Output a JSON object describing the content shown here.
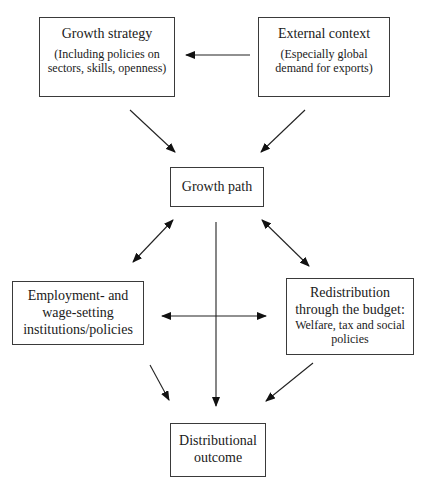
{
  "diagram": {
    "nodes": {
      "growth_strategy": {
        "title": "Growth strategy",
        "subtitle_line1": "(Including policies on",
        "subtitle_line2": "sectors, skills, openness)"
      },
      "external_context": {
        "title": "External context",
        "subtitle_line1": "(Especially global",
        "subtitle_line2": "demand for exports)"
      },
      "growth_path": {
        "title": "Growth path"
      },
      "employment_institutions": {
        "title_line1": "Employment- and",
        "title_line2": "wage-setting",
        "title_line3": "institutions/policies"
      },
      "redistribution": {
        "title_line1": "Redistribution",
        "title_line2": "through the budget:",
        "subtitle_line1": "Welfare, tax and social",
        "subtitle_line2": "policies"
      },
      "distributional_outcome": {
        "title_line1": "Distributional",
        "title_line2": "outcome"
      }
    },
    "edges": [
      {
        "from": "External context",
        "to": "Growth strategy",
        "type": "one-way"
      },
      {
        "from": "Growth strategy",
        "to": "Growth path",
        "type": "one-way"
      },
      {
        "from": "External context",
        "to": "Growth path",
        "type": "one-way"
      },
      {
        "from": "Growth path",
        "to": "Employment- and wage-setting institutions/policies",
        "type": "two-way"
      },
      {
        "from": "Growth path",
        "to": "Redistribution through the budget",
        "type": "two-way"
      },
      {
        "from": "Employment- and wage-setting institutions/policies",
        "to": "Redistribution through the budget",
        "type": "two-way"
      },
      {
        "from": "Growth path",
        "to": "Distributional outcome",
        "type": "one-way"
      },
      {
        "from": "Employment- and wage-setting institutions/policies",
        "to": "Distributional outcome",
        "type": "one-way"
      },
      {
        "from": "Redistribution through the budget",
        "to": "Distributional outcome",
        "type": "one-way"
      }
    ]
  }
}
